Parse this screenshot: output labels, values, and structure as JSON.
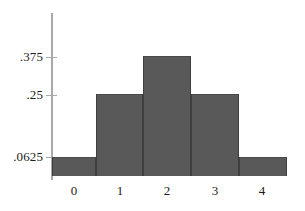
{
  "chart_data": {
    "type": "bar",
    "title": "",
    "subtitle": "",
    "xlabel": "",
    "ylabel": "",
    "categories": [
      "0",
      "1",
      "2",
      "3",
      "4"
    ],
    "values": [
      0.0625,
      0.25,
      0.375,
      0.25,
      0.0625
    ],
    "value_labels": [
      ".0625",
      ".25",
      ".375",
      ".25",
      ".0625"
    ],
    "ytick_values": [
      0.0625,
      0.25,
      0.375
    ],
    "ytick_labels": [
      ".0625",
      ".25",
      ".375"
    ],
    "xtick_labels": [
      "0",
      "1",
      "2",
      "3",
      "4"
    ],
    "xlim": [
      -0.5,
      4.5
    ],
    "ylim": [
      0,
      0.5
    ],
    "grid": false,
    "legend": null,
    "legend_position": "none",
    "bar_color": "#595959",
    "axis_color": "#a9a9a9",
    "text_color": "#1c1c1c",
    "background_color": "#ffffff",
    "annotations": []
  },
  "figure": {
    "y_axis": {
      "ticks": [
        {
          "label": ".375",
          "top": 49,
          "tick_top": 57
        },
        {
          "label": ".25",
          "top": 87,
          "tick_top": 95
        },
        {
          "label": ".0625",
          "top": 149,
          "tick_top": 157
        }
      ]
    },
    "x_axis": {
      "ticks": [
        {
          "label": "0",
          "left": 74
        },
        {
          "label": "1",
          "left": 120
        },
        {
          "label": "2",
          "left": 167
        },
        {
          "label": "3",
          "left": 215
        },
        {
          "label": "4",
          "left": 262
        }
      ]
    },
    "bars": [
      {
        "name": "bar-0",
        "left": 0,
        "width": 44,
        "height": 19
      },
      {
        "name": "bar-1",
        "left": 44,
        "width": 47,
        "height": 82
      },
      {
        "name": "bar-2",
        "left": 91,
        "width": 48,
        "height": 120
      },
      {
        "name": "bar-3",
        "left": 139,
        "width": 48,
        "height": 82
      },
      {
        "name": "bar-4",
        "left": 187,
        "width": 48,
        "height": 19
      }
    ]
  }
}
